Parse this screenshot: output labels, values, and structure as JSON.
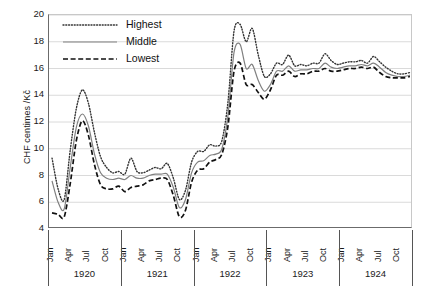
{
  "chart_data": {
    "type": "line",
    "title": "",
    "xlabel": "",
    "ylabel": "CHF centimes /Kč",
    "ylim": [
      4,
      20
    ],
    "yticks": [
      4,
      6,
      8,
      10,
      12,
      14,
      16,
      18,
      20
    ],
    "grid": true,
    "legend_position": "top-left",
    "legend": [
      "Highest",
      "Middle",
      "Lowest"
    ],
    "year_groups": [
      "1920",
      "1921",
      "1922",
      "1923",
      "1924"
    ],
    "month_ticks": [
      "Jan",
      "Apr",
      "Jul",
      "Oct"
    ],
    "x": [
      "Jan 1920",
      "Feb 1920",
      "Mar 1920",
      "Apr 1920",
      "May 1920",
      "Jun 1920",
      "Jul 1920",
      "Aug 1920",
      "Sep 1920",
      "Oct 1920",
      "Nov 1920",
      "Dec 1920",
      "Jan 1921",
      "Feb 1921",
      "Mar 1921",
      "Apr 1921",
      "May 1921",
      "Jun 1921",
      "Jul 1921",
      "Aug 1921",
      "Sep 1921",
      "Oct 1921",
      "Nov 1921",
      "Dec 1921",
      "Jan 1922",
      "Feb 1922",
      "Mar 1922",
      "Apr 1922",
      "May 1922",
      "Jun 1922",
      "Jul 1922",
      "Aug 1922",
      "Sep 1922",
      "Oct 1922",
      "Nov 1922",
      "Dec 1922",
      "Jan 1923",
      "Feb 1923",
      "Mar 1923",
      "Apr 1923",
      "May 1923",
      "Jun 1923",
      "Jul 1923",
      "Aug 1923",
      "Sep 1923",
      "Oct 1923",
      "Nov 1923",
      "Dec 1923",
      "Jan 1924",
      "Feb 1924",
      "Mar 1924",
      "Apr 1924",
      "May 1924",
      "Jun 1924",
      "Jul 1924",
      "Aug 1924",
      "Sep 1924",
      "Oct 1924",
      "Nov 1924",
      "Dec 1924"
    ],
    "series": [
      {
        "name": "Highest",
        "style": "dotted",
        "color": "#333333",
        "values": [
          9.3,
          7.0,
          6.2,
          9.9,
          13.0,
          14.4,
          13.4,
          11.2,
          9.4,
          8.6,
          8.2,
          8.3,
          8.1,
          9.3,
          8.3,
          8.2,
          8.4,
          8.6,
          8.5,
          8.9,
          7.8,
          6.2,
          6.9,
          9.0,
          9.8,
          9.8,
          10.3,
          10.2,
          10.6,
          13.5,
          18.8,
          19.3,
          18.0,
          19.0,
          17.0,
          15.4,
          15.6,
          16.4,
          16.3,
          17.0,
          16.2,
          16.3,
          16.2,
          16.4,
          16.4,
          17.1,
          16.6,
          16.3,
          16.4,
          16.5,
          16.5,
          16.6,
          16.4,
          16.9,
          16.5,
          16.1,
          15.8,
          15.6,
          15.6,
          15.7
        ]
      },
      {
        "name": "Middle",
        "style": "solid",
        "color": "#808080",
        "values": [
          7.6,
          6.0,
          5.5,
          8.6,
          11.6,
          12.6,
          11.7,
          9.6,
          8.2,
          7.8,
          7.7,
          7.8,
          7.7,
          8.0,
          7.8,
          7.8,
          8.0,
          8.1,
          8.1,
          8.1,
          7.1,
          5.6,
          6.2,
          8.2,
          9.0,
          9.1,
          9.5,
          9.6,
          10.0,
          12.5,
          17.2,
          17.8,
          16.0,
          16.3,
          15.1,
          14.3,
          14.8,
          15.8,
          15.8,
          16.2,
          15.8,
          15.9,
          15.9,
          16.0,
          16.0,
          16.4,
          16.1,
          16.0,
          16.1,
          16.2,
          16.2,
          16.3,
          16.2,
          16.4,
          16.1,
          15.7,
          15.5,
          15.4,
          15.4,
          15.5
        ]
      },
      {
        "name": "Lowest",
        "style": "dashed",
        "color": "#111111",
        "values": [
          5.2,
          5.1,
          4.9,
          7.4,
          10.6,
          12.1,
          11.0,
          8.8,
          7.3,
          7.0,
          7.0,
          7.2,
          6.8,
          7.1,
          7.2,
          7.3,
          7.6,
          7.7,
          7.8,
          7.7,
          6.5,
          4.9,
          5.4,
          7.5,
          8.4,
          8.5,
          9.0,
          9.2,
          9.6,
          11.7,
          15.8,
          16.4,
          14.8,
          14.8,
          14.2,
          13.7,
          14.4,
          15.5,
          15.5,
          15.8,
          15.4,
          15.6,
          15.6,
          15.8,
          15.8,
          16.0,
          15.8,
          15.8,
          15.9,
          16.0,
          16.0,
          16.1,
          16.0,
          16.1,
          15.7,
          15.4,
          15.3,
          15.3,
          15.3,
          15.4
        ]
      }
    ]
  }
}
